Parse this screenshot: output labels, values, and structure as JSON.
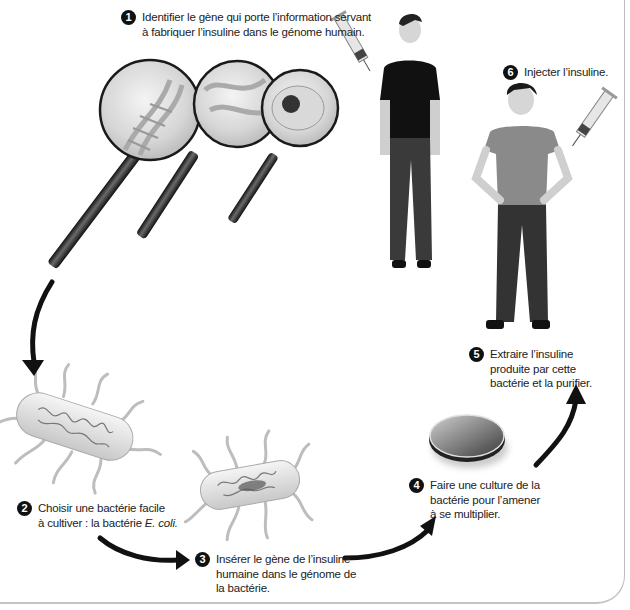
{
  "diagram": {
    "steps": [
      {
        "number": "1",
        "text": "Identifier le gène qui porte l’information servant\nà fabriquer l’insuline dans le génome humain."
      },
      {
        "number": "2",
        "text_main": "Choisir une bactérie facile\nà cultiver : la bactérie ",
        "text_italic": "E. coli."
      },
      {
        "number": "3",
        "text": "Insérer le gène de l’insuline\nhumaine dans le génome de\nla bactérie."
      },
      {
        "number": "4",
        "text": "Faire une culture de la\nbactérie pour l’amener\nà se multiplier."
      },
      {
        "number": "5",
        "text": "Extraire l’insuline\nproduite par cette\nbactérie et la purifier."
      },
      {
        "number": "6",
        "text": "Injecter l’insuline."
      }
    ],
    "illustrations": [
      {
        "name": "magnifying-glass-dna",
        "depicts": "DNA double helix"
      },
      {
        "name": "magnifying-glass-chromosome",
        "depicts": "chromosome strands"
      },
      {
        "name": "magnifying-glass-cell",
        "depicts": "cell with nucleus"
      },
      {
        "name": "woman-donor",
        "depicts": "standing woman in black t-shirt and jeans"
      },
      {
        "name": "syringe-1",
        "depicts": "syringe"
      },
      {
        "name": "bacterium-1",
        "depicts": "E. coli bacterium with flagella"
      },
      {
        "name": "bacterium-2",
        "depicts": "modified bacterium with inserted gene"
      },
      {
        "name": "petri-dish",
        "depicts": "culture dish"
      },
      {
        "name": "man-patient",
        "depicts": "standing man, hands on hips"
      },
      {
        "name": "syringe-2",
        "depicts": "syringe injecting insulin"
      }
    ],
    "colors": {
      "badge": "#111111",
      "arrow": "#111111",
      "text": "#222222",
      "frame": "#c4c4c4"
    }
  }
}
